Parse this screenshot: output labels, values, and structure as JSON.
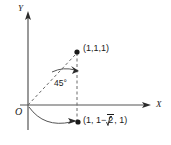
{
  "figure": {
    "background_color": "#ffffff",
    "line_color": "#4a4a4a",
    "text_color": "#1a1a1a"
  },
  "axes": {
    "y_label": "Y",
    "x_label": "X",
    "origin_label": "O"
  },
  "annotations": {
    "angle_label": "45°",
    "angle_degrees": 45
  },
  "points": [
    {
      "id": "top-point",
      "label": "(1,1,1)",
      "coords": [
        1,
        1,
        1
      ],
      "pixel": [
        77,
        52
      ]
    },
    {
      "id": "bottom-point",
      "label_prefix": "(1, 1−",
      "label_radical": "2",
      "label_suffix": ", 1)",
      "label_plain": "(1, 1−√2, 1)",
      "pixel": [
        77,
        122
      ]
    }
  ]
}
